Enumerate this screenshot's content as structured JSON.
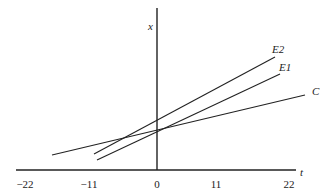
{
  "diagram": {
    "axes": {
      "horizontal_label": "t",
      "vertical_label": "x",
      "tick_labels": [
        "−22",
        "−11",
        "0",
        "11",
        "22"
      ]
    },
    "lines": [
      {
        "name": "E2",
        "label": "E2"
      },
      {
        "name": "E1",
        "label": "E1"
      },
      {
        "name": "C",
        "label": "C"
      }
    ],
    "colors": {
      "line": "#222222",
      "background": "#ffffff"
    }
  }
}
